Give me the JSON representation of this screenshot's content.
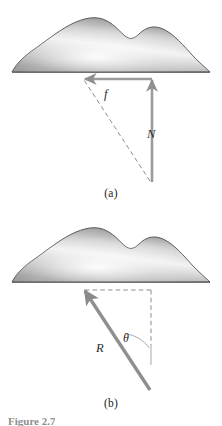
{
  "figure": {
    "number_label": "Figure 2.7",
    "panels": [
      {
        "id": "a",
        "caption": "(a)",
        "terrain": "hill-silhouette-shaded",
        "vectors": [
          {
            "name": "f",
            "label": "f",
            "style": "solid-arrow",
            "direction": "left",
            "color": "#9b9b9b"
          },
          {
            "name": "N",
            "label": "N",
            "style": "solid-arrow",
            "direction": "up",
            "color": "#9b9b9b"
          },
          {
            "name": "resultant-construction",
            "label": "",
            "style": "dashed-line",
            "direction": "diagonal",
            "color": "#8c8c8c"
          }
        ]
      },
      {
        "id": "b",
        "caption": "(b)",
        "terrain": "hill-silhouette-shaded",
        "vectors": [
          {
            "name": "R",
            "label": "R",
            "style": "solid-arrow",
            "direction": "up-left",
            "color": "#8f8f8f"
          },
          {
            "name": "horizontal-component",
            "label": "",
            "style": "dashed-line",
            "direction": "left",
            "color": "#8c8c8c"
          },
          {
            "name": "vertical-component",
            "label": "",
            "style": "dashed-line",
            "direction": "down",
            "color": "#8c8c8c"
          }
        ],
        "angle": {
          "name": "theta",
          "label": "θ"
        }
      }
    ],
    "colors": {
      "hill_outline": "#4a4a4a",
      "hill_fill_light": "#f2f2f2",
      "hill_fill_dark": "#8e8e8e",
      "vector_gray": "#9b9b9b",
      "dashed_gray": "#8c8c8c",
      "background": "#ffffff",
      "text": "#232323"
    }
  }
}
